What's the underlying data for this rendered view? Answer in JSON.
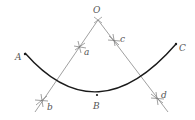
{
  "figure": {
    "colors": {
      "line": "#888888",
      "arc": "#1a1a1a",
      "label": "#555555",
      "background": "#ffffff"
    },
    "labels": {
      "O": "O",
      "A": "A",
      "B": "B",
      "C": "C",
      "a": "a",
      "b": "b",
      "c": "c",
      "d": "d"
    },
    "points": {
      "O": [
        98,
        20
      ],
      "A": [
        25,
        53
      ],
      "B": [
        97,
        96
      ],
      "C": [
        176,
        44
      ],
      "a": [
        80,
        47
      ],
      "b": [
        42,
        100
      ],
      "c": [
        114,
        40
      ],
      "d": [
        157,
        98
      ]
    }
  }
}
